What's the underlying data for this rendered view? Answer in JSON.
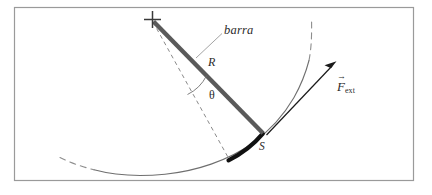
{
  "figure": {
    "kind": "physics-diagram",
    "title_visible": false,
    "frame": {
      "x": 14,
      "y": 7,
      "width": 400,
      "height": 174,
      "border_color": "#9a9a9a",
      "fill_color": "#ffffff"
    },
    "colors": {
      "bar": "#5a5a5a",
      "arc_solid": "#6f6f6f",
      "arc_dashed": "#8d8d8d",
      "arc_thick_black": "#111111",
      "dashed_radius": "#8a8a8a",
      "leader_line": "#9a9a9a",
      "force_arrow": "#1a1a1a",
      "text": "#2b2b2b",
      "pivot_cross": "#3a3a3a"
    },
    "geometry": {
      "pivot": {
        "x": 152,
        "y": 19,
        "marker": "cross"
      },
      "bar_tip": {
        "x": 263,
        "y": 133
      },
      "arc_center": {
        "x": 152,
        "y": 19
      },
      "arc_radius": 157,
      "equilibrium_point": {
        "x": 229,
        "y": 160
      },
      "force_arrow_tail": {
        "x": 266,
        "y": 135
      },
      "force_arrow_head": {
        "x": 336,
        "y": 62
      }
    },
    "labels": {
      "bar": "barra",
      "radius": "R",
      "angle": "θ",
      "arc_length": "S",
      "force_symbol": "F",
      "force_subscript": "ext",
      "force_vector_accent": "→"
    }
  }
}
